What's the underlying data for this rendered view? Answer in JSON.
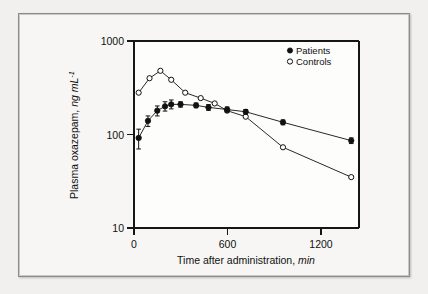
{
  "figure": {
    "background_color": "#f1f0ee",
    "panel_color": "#f7f6f4",
    "frame_color": "#8d8d8d",
    "ink_color": "#111111"
  },
  "chart_data": {
    "type": "line",
    "title": "",
    "subtitle": "",
    "xlabel_text": "Time after administration, ",
    "xlabel_unit": "min",
    "ylabel_text": "Plasma oxazepam, ",
    "ylabel_unit": "ng mL",
    "ylabel_exponent": "-1",
    "xscale": "linear",
    "yscale": "log",
    "xlim": [
      0,
      1450
    ],
    "ylim": [
      10,
      1000
    ],
    "xticks": [
      0,
      600,
      1200
    ],
    "xtick_labels": [
      "0",
      "600",
      "1200"
    ],
    "yticks": [
      10,
      100,
      1000
    ],
    "ytick_labels": [
      "10",
      "100",
      "1000"
    ],
    "grid": false,
    "legend_position": "top-right",
    "series": [
      {
        "name": "Patients",
        "marker": "filled-circle",
        "has_error_bars": true,
        "x": [
          30,
          90,
          150,
          200,
          240,
          300,
          400,
          480,
          600,
          720,
          960,
          1400
        ],
        "y": [
          92,
          140,
          180,
          200,
          210,
          210,
          205,
          195,
          185,
          175,
          135,
          86
        ],
        "yerr_low": [
          22,
          18,
          22,
          22,
          22,
          14,
          12,
          14,
          12,
          10,
          8,
          6
        ],
        "yerr_high": [
          22,
          18,
          22,
          24,
          24,
          14,
          12,
          14,
          12,
          10,
          8,
          6
        ]
      },
      {
        "name": "Controls",
        "marker": "open-circle",
        "has_error_bars": false,
        "x": [
          30,
          100,
          170,
          240,
          330,
          430,
          520,
          600,
          720,
          960,
          1400
        ],
        "y": [
          280,
          400,
          480,
          385,
          280,
          245,
          215,
          180,
          155,
          73,
          35
        ],
        "yerr_low": [],
        "yerr_high": []
      }
    ],
    "legend": [
      {
        "label": "Patients",
        "marker": "filled-circle"
      },
      {
        "label": "Controls",
        "marker": "open-circle"
      }
    ]
  }
}
